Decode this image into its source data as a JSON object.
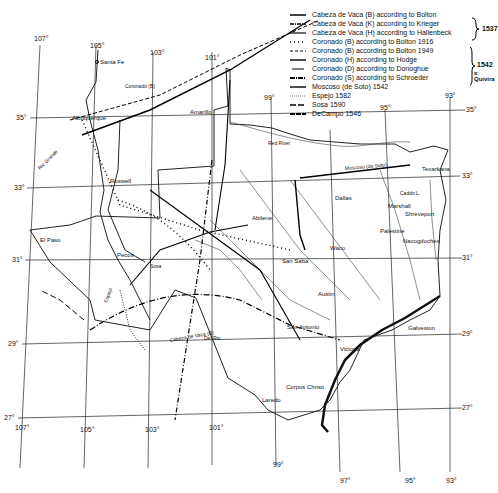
{
  "map": {
    "longitude_labels_top": [
      "107°",
      "105°",
      "103°",
      "101°",
      "99°",
      "95°",
      "93°"
    ],
    "longitude_labels_bottom": [
      "107°",
      "105°",
      "103°",
      "101°",
      "99°",
      "97°",
      "95°",
      "93°"
    ],
    "latitude_labels_left": [
      "35°",
      "33°",
      "31°",
      "29°",
      "27°"
    ],
    "latitude_labels_right": [
      "35°",
      "33°",
      "31°",
      "29°",
      "27°"
    ],
    "places": {
      "santa_fe": "Santa Fe",
      "albuquerque": "Albuquerque",
      "amarillo": "Amarillo",
      "roswell": "Roswell",
      "el_paso": "El Paso",
      "pecos": "Pecos",
      "abilene": "Abilene",
      "san_saba": "San Saba",
      "dallas": "Dallas",
      "waco": "Waco",
      "austin": "Austin",
      "san_antonio": "San Antonio",
      "victoria": "Victoria",
      "corpus_christi": "Corpus Christi",
      "laredo": "Laredo",
      "galveston": "Galveston",
      "texarkana": "Texarkana",
      "marshall": "Marshall",
      "shreveport": "Shreveport",
      "palestine": "Palestine",
      "nacogdoches": "Nacogdoches",
      "caddo_lake": "Caddo L.",
      "coronado_b": "Coronado (B)"
    },
    "rivers": {
      "rio_grande": "Rio Grande",
      "red_river": "Red River",
      "pecos_river": "Pecos",
      "colorado": "Colorado",
      "brazos": "Brazos",
      "sabine": "Sabine",
      "del_rio": "Del Rio"
    },
    "route_labels": {
      "cabeza_b": "Cabeza de Vaca (B)",
      "moscoso": "Moscoso (de Soto)",
      "espejo": "Espejo",
      "sosa": "Sosa",
      "coronado_h": "Coronado (H)"
    }
  },
  "legend": {
    "items": [
      {
        "label": "Cabeza de Vaca (B) according to Bolton",
        "style": "solid"
      },
      {
        "label": "Cabeza de Vaca (K) according to Krieger",
        "style": "dashdot"
      },
      {
        "label": "Cabeza de Vaca (H) according to Hallenbeck",
        "style": "solid"
      },
      {
        "label": "Coronado (B) according to Bolton 1916",
        "style": "dotted"
      },
      {
        "label": "Coronado (B) according to Bolton 1949",
        "style": "dashed"
      },
      {
        "label": "Coronado (H) according to Hodge",
        "style": "solid"
      },
      {
        "label": "Coronado (D) according to Donoghue",
        "style": "solid-thin"
      },
      {
        "label": "Coronado (S) according to Schroeder",
        "style": "dash-dot-heavy"
      },
      {
        "label": "Moscoso (de Soto) 1542",
        "style": "solid"
      },
      {
        "label": "Espejo 1582",
        "style": "fine-dotted"
      },
      {
        "label": "Sosa 1590",
        "style": "long-dash"
      },
      {
        "label": "DeCampo 1546",
        "style": "heavy-dash"
      }
    ],
    "bracket_1537": "1537",
    "bracket_1542": "1542",
    "bracket_quivira": "x Quivira"
  }
}
